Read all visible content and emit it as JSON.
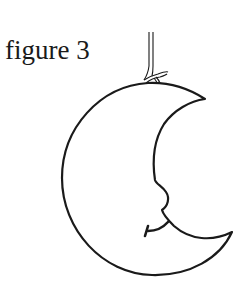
{
  "figure": {
    "caption": "figure 3",
    "icons": [
      "crescent-moon-icon",
      "string-icon",
      "knot-icon"
    ],
    "colors": {
      "stroke": "#1a1a1a",
      "background": "#ffffff"
    }
  }
}
